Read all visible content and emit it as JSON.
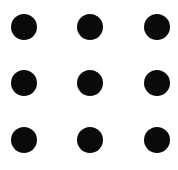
{
  "diagram": {
    "type": "dot-grid",
    "rows": 3,
    "cols": 3,
    "background": "#ffffff",
    "dot_color": "#0a0a0a",
    "dot_diameter": 26,
    "col_centers": [
      24,
      90,
      157
    ],
    "row_centers": [
      27,
      83,
      140
    ],
    "dots": [
      {
        "row": 0,
        "col": 0
      },
      {
        "row": 0,
        "col": 1
      },
      {
        "row": 0,
        "col": 2
      },
      {
        "row": 1,
        "col": 0
      },
      {
        "row": 1,
        "col": 1
      },
      {
        "row": 1,
        "col": 2
      },
      {
        "row": 2,
        "col": 0
      },
      {
        "row": 2,
        "col": 1
      },
      {
        "row": 2,
        "col": 2
      }
    ]
  }
}
